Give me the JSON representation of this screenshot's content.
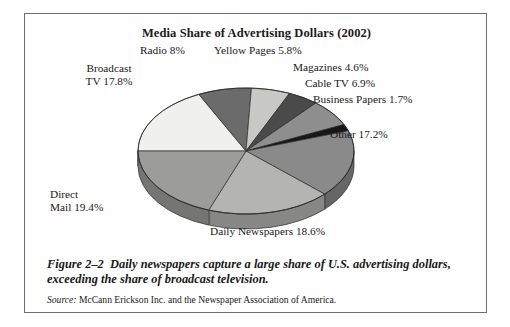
{
  "figure": {
    "title": "Media Share of Advertising Dollars (2002)",
    "caption_number": "Figure 2–2",
    "caption_text": "Daily newspapers capture a large share of U.S. advertising dollars, exceeding the share of broadcast television.",
    "source_label": "Source:",
    "source_text": "McCann Erickson Inc. and the Newspaper Association of America."
  },
  "labels": {
    "radio": "Radio 8%",
    "yellow_pages": "Yellow Pages 5.8%",
    "magazines": "Magazines 4.6%",
    "cable_tv": "Cable TV 6.9%",
    "business_papers": "Business Papers 1.7%",
    "other": "Other 17.2%",
    "broadcast_tv": "Broadcast\nTV 17.8%",
    "broadcast_tv_line1": "Broadcast",
    "broadcast_tv_line2": "TV 17.8%",
    "direct_mail_line1": "Direct",
    "direct_mail_line2": "Mail 19.4%",
    "daily_newspapers": "Daily Newspapers 18.6%"
  },
  "chart_data": {
    "type": "pie",
    "title": "Media Share of Advertising Dollars (2002)",
    "xlabel": "",
    "ylabel": "",
    "units": "percent",
    "legend_position": "none-labels-outside",
    "grid": false,
    "three_d": true,
    "start_angle_deg": 180,
    "direction": "clockwise",
    "categories": [
      "Broadcast TV",
      "Radio",
      "Yellow Pages",
      "Magazines",
      "Cable TV",
      "Business Papers",
      "Other",
      "Daily Newspapers",
      "Direct Mail"
    ],
    "values": [
      17.8,
      8.0,
      5.8,
      4.6,
      6.9,
      1.7,
      17.2,
      18.6,
      19.4
    ],
    "total": 100.0,
    "slice_colors": [
      "#f0f0ee",
      "#6b6b6b",
      "#c8c8c6",
      "#4a4a4a",
      "#8e8e8e",
      "#171717",
      "#8a8a8a",
      "#b4b4b2",
      "#9c9c9a"
    ],
    "slice_side_colors": [
      "#b9b9b6",
      "#4e4e4e",
      "#979795",
      "#353535",
      "#6a6a6a",
      "#101010",
      "#666666",
      "#878785",
      "#757573"
    ],
    "data_labels": [
      "Broadcast TV 17.8%",
      "Radio 8%",
      "Yellow Pages 5.8%",
      "Magazines 4.6%",
      "Cable TV 6.9%",
      "Business Papers 1.7%",
      "Other 17.2%",
      "Daily Newspapers 18.6%",
      "Direct Mail 19.4%"
    ]
  },
  "style": {
    "frame_border": "#6e6e6e",
    "page_background": "#ffffff",
    "text_color": "#1a1a1a"
  }
}
